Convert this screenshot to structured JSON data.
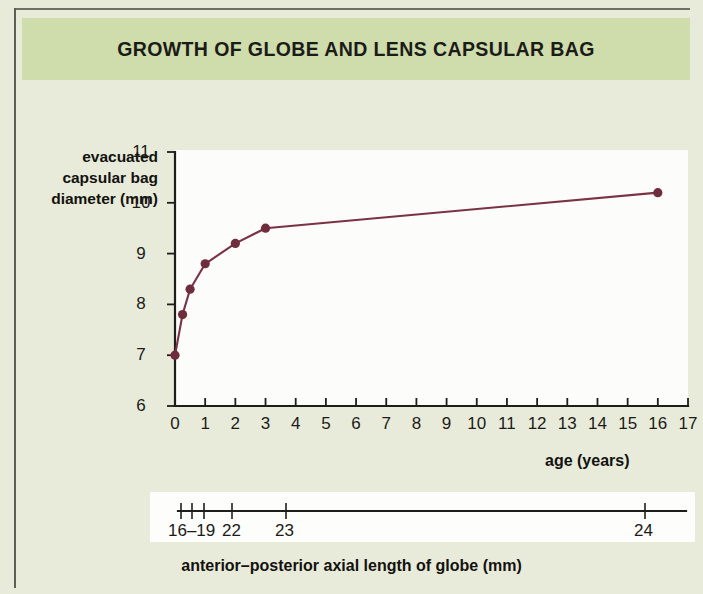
{
  "figure": {
    "title": "GROWTH OF GLOBE AND LENS CAPSULAR BAG",
    "title_band_color": "#cfdcab",
    "background_color": "#e9ebda",
    "plot_background_color": "#fcfcfa",
    "series_color": "#7a3244"
  },
  "y_axis_label_lines": {
    "line1": "evacuated",
    "line2": "capsular bag",
    "line3": "diameter (mm)"
  },
  "x_axis_title": "age (years)",
  "secondary_axis": {
    "title": "anterior–posterior axial length of globe (mm)",
    "labels": [
      "16–19",
      "22",
      "23",
      "24"
    ]
  },
  "chart_data": {
    "type": "line",
    "title": "GROWTH OF GLOBE AND LENS CAPSULAR BAG",
    "xlabel": "age (years)",
    "ylabel": "evacuated capsular bag diameter (mm)",
    "xlim": [
      0,
      17
    ],
    "ylim": [
      6,
      11
    ],
    "xticks": [
      0,
      1,
      2,
      3,
      4,
      5,
      6,
      7,
      8,
      9,
      10,
      11,
      12,
      13,
      14,
      15,
      16,
      17
    ],
    "xticklabels": [
      "0",
      "1",
      "2",
      "3",
      "4",
      "5",
      "6",
      "7",
      "8",
      "9",
      "10",
      "11",
      "12",
      "13",
      "14",
      "15",
      "16",
      "17"
    ],
    "yticks": [
      6,
      7,
      8,
      9,
      10,
      11
    ],
    "yticklabels": [
      "6",
      "7",
      "8",
      "9",
      "10",
      "11"
    ],
    "grid": false,
    "legend": null,
    "markers": true,
    "x": [
      0,
      0.25,
      0.5,
      1,
      2,
      3,
      16
    ],
    "y": [
      7.0,
      7.8,
      8.3,
      8.8,
      9.2,
      9.5,
      10.2
    ],
    "series": [
      {
        "name": "evacuated capsular bag diameter",
        "points": [
          {
            "x": 0,
            "y": 7.0
          },
          {
            "x": 0.25,
            "y": 7.8
          },
          {
            "x": 0.5,
            "y": 8.3
          },
          {
            "x": 1,
            "y": 8.8
          },
          {
            "x": 2,
            "y": 9.2
          },
          {
            "x": 3,
            "y": 9.5
          },
          {
            "x": 16,
            "y": 10.2
          }
        ],
        "color": "#7a3244"
      }
    ],
    "secondary_xaxis": {
      "label": "anterior–posterior axial length of globe (mm)",
      "tick_labels": [
        "16–19",
        "22",
        "23",
        "24"
      ],
      "tick_positions_years": [
        0.0,
        0.35,
        0.75,
        1.7,
        3.5,
        15.5
      ]
    }
  },
  "y_tick_labels": [
    "11",
    "10",
    "9",
    "8",
    "7",
    "6"
  ],
  "x_tick_labels": [
    "0",
    "1",
    "2",
    "3",
    "4",
    "5",
    "6",
    "7",
    "8",
    "9",
    "10",
    "11",
    "12",
    "13",
    "14",
    "15",
    "16",
    "17"
  ]
}
